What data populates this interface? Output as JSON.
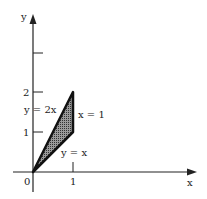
{
  "diagram": {
    "type": "region-plot",
    "axes": {
      "x_label": "x",
      "y_label": "y",
      "origin_label": "0",
      "x_ticks": [
        {
          "value": 1,
          "label": "1"
        }
      ],
      "y_ticks": [
        {
          "value": 1,
          "label": "1"
        },
        {
          "value": 2,
          "label": "2"
        },
        {
          "value": 3,
          "label": ""
        }
      ]
    },
    "curves": [
      {
        "equation": "y = 2x",
        "label": "y = 2x"
      },
      {
        "equation": "y = x",
        "label": "y = x"
      },
      {
        "equation": "x = 1",
        "label": "x = 1"
      }
    ],
    "region": {
      "description": "Shaded triangle bounded by y = x, y = 2x and x = 1",
      "vertices": [
        [
          0,
          0
        ],
        [
          1,
          2
        ],
        [
          1,
          1
        ]
      ],
      "fill": "#555555",
      "stroke": "#111111"
    },
    "colors": {
      "axis": "#222222",
      "background": "#ffffff"
    }
  }
}
